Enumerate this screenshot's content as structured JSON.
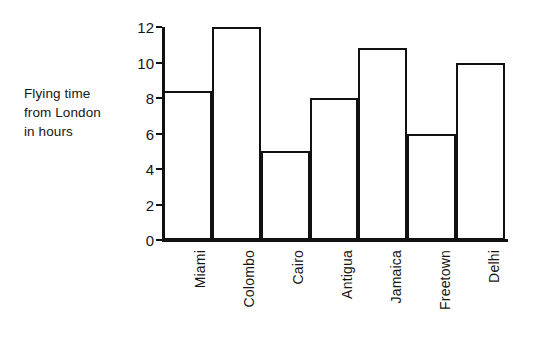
{
  "chart_data": {
    "type": "bar",
    "title": "",
    "subtitle": "",
    "categories": [
      "Miami",
      "Colombo",
      "Cairo",
      "Antigua",
      "Jamaica",
      "Freetown",
      "Delhi"
    ],
    "values": [
      8.4,
      12,
      5,
      8,
      10.8,
      6,
      10
    ],
    "xlabel": "",
    "ylabel": "Flying time from London in hours",
    "ylabel_lines": [
      "Flying time",
      "from London",
      "in hours"
    ],
    "ylim": [
      0,
      12
    ],
    "ytick_values": [
      0,
      2,
      4,
      6,
      8,
      10,
      12
    ],
    "ytick_labels": [
      "0",
      "2",
      "4",
      "6",
      "8",
      "10",
      "12"
    ],
    "grid": false,
    "legend": null,
    "bar_style": "outline",
    "bar_gap": 0,
    "colors": {
      "bar_outline": "#111111",
      "bar_fill": "#ffffff",
      "axis": "#111111",
      "text": "#161616",
      "background": "#ffffff"
    }
  }
}
